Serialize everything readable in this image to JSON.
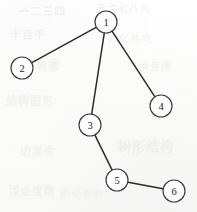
{
  "diagram": {
    "type": "node-link-graph",
    "width": 197,
    "height": 212,
    "background_color": "#fbfbfa",
    "node_fill_color": "#ffffff",
    "node_stroke_color": "#3a3a3a",
    "edge_color": "#2b2b2b",
    "label_color": "#262626",
    "node_radius": 11,
    "nodes": [
      {
        "id": "1",
        "label": "1",
        "x": 106,
        "y": 22
      },
      {
        "id": "2",
        "label": "2",
        "x": 22,
        "y": 68
      },
      {
        "id": "3",
        "label": "3",
        "x": 90,
        "y": 125
      },
      {
        "id": "4",
        "label": "4",
        "x": 161,
        "y": 106
      },
      {
        "id": "5",
        "label": "5",
        "x": 117,
        "y": 180
      },
      {
        "id": "6",
        "label": "6",
        "x": 174,
        "y": 191
      }
    ],
    "edges": [
      {
        "from": "1",
        "to": "2"
      },
      {
        "from": "1",
        "to": "3"
      },
      {
        "from": "1",
        "to": "4"
      },
      {
        "from": "3",
        "to": "5"
      },
      {
        "from": "5",
        "to": "6"
      }
    ]
  },
  "artifacts": {
    "description": "faint scanner bleed-through ghost marks on paper",
    "marks": [
      {
        "text": "一二三四",
        "x": 18,
        "y": 6,
        "size": 11,
        "opacity": 0.5,
        "rotate": -1
      },
      {
        "text": "五六七八九",
        "x": 96,
        "y": 4,
        "size": 10,
        "opacity": 0.42,
        "rotate": 0
      },
      {
        "text": "十百千",
        "x": 10,
        "y": 30,
        "size": 11,
        "opacity": 0.45,
        "rotate": 0
      },
      {
        "text": "万亿兆兆",
        "x": 108,
        "y": 34,
        "size": 10,
        "opacity": 0.38,
        "rotate": 1
      },
      {
        "text": "图表数据",
        "x": 12,
        "y": 60,
        "size": 11,
        "opacity": 0.4,
        "rotate": 0
      },
      {
        "text": "节点连接",
        "x": 128,
        "y": 62,
        "size": 10,
        "opacity": 0.34,
        "rotate": 0
      },
      {
        "text": "结构图形",
        "x": 6,
        "y": 96,
        "size": 11,
        "opacity": 0.42,
        "rotate": 0
      },
      {
        "text": "树形结构",
        "x": 118,
        "y": 140,
        "size": 13,
        "opacity": 0.5,
        "rotate": 0
      },
      {
        "text": "边集合",
        "x": 20,
        "y": 146,
        "size": 11,
        "opacity": 0.36,
        "rotate": 0
      },
      {
        "text": "顶点度数",
        "x": 8,
        "y": 186,
        "size": 11,
        "opacity": 0.4,
        "rotate": 0
      },
      {
        "text": "图论基础",
        "x": 60,
        "y": 190,
        "size": 10,
        "opacity": 0.3,
        "rotate": 0
      }
    ]
  }
}
